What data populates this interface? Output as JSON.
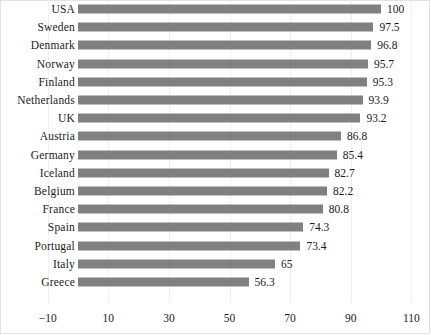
{
  "chart_data": {
    "type": "bar",
    "orientation": "horizontal",
    "title": "",
    "subtitle": "",
    "xlabel": "",
    "ylabel": "",
    "xlim": [
      -10,
      110
    ],
    "xticks": [
      "−10",
      "10",
      "30",
      "50",
      "70",
      "90",
      "110"
    ],
    "xtick_values": [
      -10,
      10,
      30,
      50,
      70,
      90,
      110
    ],
    "grid": "vertical-only",
    "legend": "none",
    "bar_color": "#808080",
    "background_color": "#ffffff",
    "categories": [
      "USA",
      "Sweden",
      "Denmark",
      "Norway",
      "Finland",
      "Netherlands",
      "UK",
      "Austria",
      "Germany",
      "Iceland",
      "Belgium",
      "France",
      "Spain",
      "Portugal",
      "Italy",
      "Greece"
    ],
    "values": [
      100,
      97.5,
      96.8,
      95.7,
      95.3,
      93.9,
      93.2,
      86.8,
      85.4,
      82.7,
      82.2,
      80.8,
      74.3,
      73.4,
      65,
      56.3
    ],
    "value_labels": [
      "100",
      "97.5",
      "96.8",
      "95.7",
      "95.3",
      "93.9",
      "93.2",
      "86.8",
      "85.4",
      "82.7",
      "82.2",
      "80.8",
      "74.3",
      "73.4",
      "65",
      "56.3"
    ],
    "bars": [
      {
        "label": "USA",
        "value": 100,
        "value_label": "100"
      },
      {
        "label": "Sweden",
        "value": 97.5,
        "value_label": "97.5"
      },
      {
        "label": "Denmark",
        "value": 96.8,
        "value_label": "96.8"
      },
      {
        "label": "Norway",
        "value": 95.7,
        "value_label": "95.7"
      },
      {
        "label": "Finland",
        "value": 95.3,
        "value_label": "95.3"
      },
      {
        "label": "Netherlands",
        "value": 93.9,
        "value_label": "93.9"
      },
      {
        "label": "UK",
        "value": 93.2,
        "value_label": "93.2"
      },
      {
        "label": "Austria",
        "value": 86.8,
        "value_label": "86.8"
      },
      {
        "label": "Germany",
        "value": 85.4,
        "value_label": "85.4"
      },
      {
        "label": "Iceland",
        "value": 82.7,
        "value_label": "82.7"
      },
      {
        "label": "Belgium",
        "value": 82.2,
        "value_label": "82.2"
      },
      {
        "label": "France",
        "value": 80.8,
        "value_label": "80.8"
      },
      {
        "label": "Spain",
        "value": 74.3,
        "value_label": "74.3"
      },
      {
        "label": "Portugal",
        "value": 73.4,
        "value_label": "73.4"
      },
      {
        "label": "Italy",
        "value": 65,
        "value_label": "65"
      },
      {
        "label": "Greece",
        "value": 56.3,
        "value_label": "56.3"
      }
    ]
  }
}
